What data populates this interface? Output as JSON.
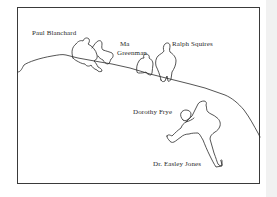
{
  "figure": {
    "frame_color": "#3a3a3a",
    "line_color": "#2a2a2a",
    "labels": {
      "paul_blanchard": "Paul Blanchard",
      "ma": "Ma",
      "greenman": "Greenman",
      "ralph_squires": "Ralph Squires",
      "dorothy_frye": "Dorothy Frye",
      "easley_jones": "Dr. Easley Jones"
    },
    "figures": [
      {
        "name": "Paul Blanchard",
        "pose": "crouching on hilltop"
      },
      {
        "name": "Ma Greenman",
        "pose": "crouching figures on slope"
      },
      {
        "name": "Ralph Squires",
        "pose": "standing on slope"
      },
      {
        "name": "Dorothy Frye",
        "pose": "small figure below the ridge"
      },
      {
        "name": "Dr. Easley Jones",
        "pose": "climbing, arm outstretched"
      }
    ]
  }
}
